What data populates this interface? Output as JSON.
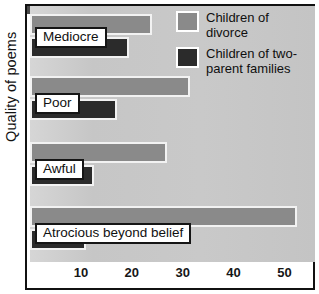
{
  "chart_data": {
    "type": "bar",
    "orientation": "horizontal",
    "title": "",
    "xlabel": "",
    "ylabel": "Quality of poems",
    "xlim": [
      0,
      56
    ],
    "grid": false,
    "legend_position": "top-right",
    "categories": [
      "Mediocre",
      "Poor",
      "Awful",
      "Atrocious beyond belief"
    ],
    "xticks": [
      10,
      20,
      30,
      40,
      50
    ],
    "xtick_labels": [
      "10",
      "20",
      "30",
      "40",
      "50"
    ],
    "series": [
      {
        "name": "Children of divorce",
        "color": "#8a8a8a",
        "values": [
          24,
          31.5,
          27,
          52.5
        ]
      },
      {
        "name": "Children of two-parent families",
        "color": "#2b2b2b",
        "values": [
          19.5,
          17,
          12.5,
          11
        ]
      }
    ]
  },
  "legend": {
    "items": [
      {
        "label_line1": "Children of",
        "label_line2": "divorce",
        "swatch": "light"
      },
      {
        "label_line1": "Children of two-",
        "label_line2": "parent families",
        "swatch": "dark"
      }
    ]
  },
  "colors": {
    "series_light": "#8a8a8a",
    "series_dark": "#2b2b2b",
    "plot_background": "#c9c9c9",
    "frame": "#111111",
    "callout_background": "#ffffff",
    "text": "#101010"
  }
}
